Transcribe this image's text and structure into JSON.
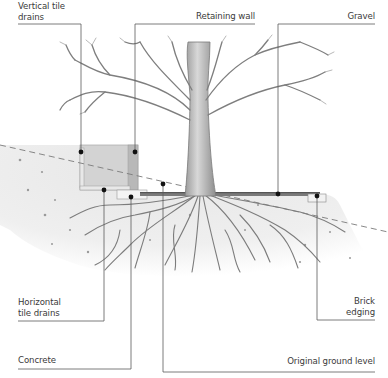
{
  "diagram": {
    "labels": {
      "vertical_tile_drains": {
        "line1": "Vertical tile",
        "line2": "drains"
      },
      "retaining_wall": "Retaining wall",
      "gravel": "Gravel",
      "horizontal_tile_drains": {
        "line1": "Horizontal",
        "line2": "tile drains"
      },
      "brick_edging": {
        "line1": "Brick",
        "line2": "edging"
      },
      "concrete": "Concrete",
      "original_ground_level": "Original ground level"
    },
    "colors": {
      "leader_line": "#5a5a5a",
      "dot": "#111111",
      "soil": "#ececec",
      "soil_dark": "#d6d6d6",
      "wall": "#cfcfcf",
      "wall_dark": "#b4b4b4",
      "gravel": "#6e6e6e",
      "tree": "#8a8a8a",
      "text": "#3a3a3a"
    }
  }
}
